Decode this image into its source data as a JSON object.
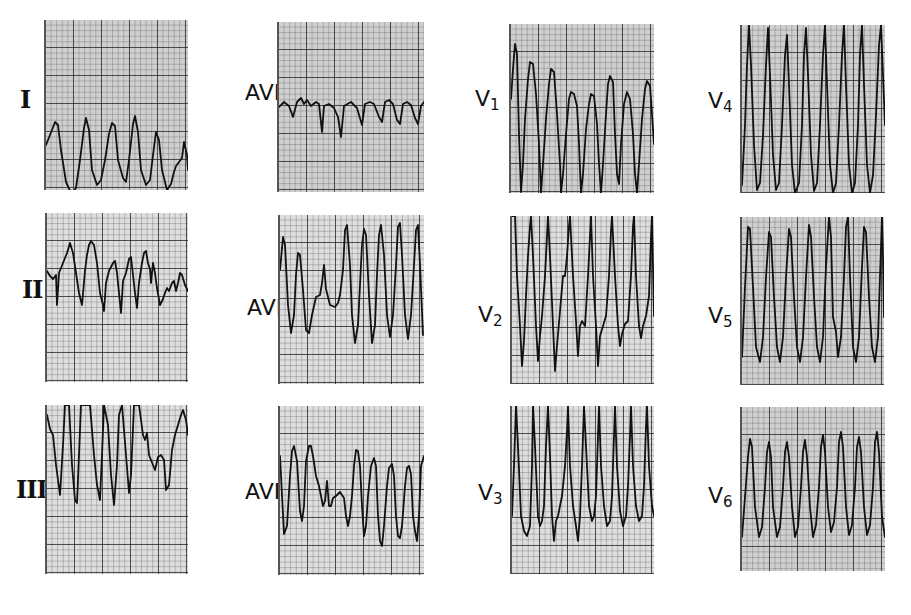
{
  "figure": {
    "leads": [
      {
        "id": "I",
        "label": "I",
        "sub": "",
        "roman": true,
        "panel": {
          "x": 44,
          "y": 20,
          "w": 142,
          "h": 170,
          "light": false
        },
        "labelPos": {
          "x": 20,
          "y": 100
        },
        "trace": "0,125 6,110 9,102 12,105 15,130 20,162 26,175 30,168 34,140 38,108 40,98 43,110 46,150 51,165 55,160 59,140 63,114 66,103 69,106 72,140 77,158 80,162 83,140 87,104 89,96 92,112 95,150 100,165 104,160 107,135 110,112 113,120 116,150 121,170 125,164 128,152 130,146 133,142 136,138 138,122 141,135 142,150"
      },
      {
        "id": "AVR",
        "label": "AVR",
        "sub": "",
        "roman": false,
        "panel": {
          "x": 277,
          "y": 22,
          "w": 145,
          "h": 170,
          "light": false
        },
        "labelPos": {
          "x": 245,
          "y": 94
        },
        "trace": "0,85 5,80 10,84 14,95 18,80 22,76 25,82 28,78 32,84 37,80 40,82 43,110 45,84 50,82 55,86 59,95 62,115 65,84 72,80 78,86 83,103 86,82 91,80 95,82 100,95 103,100 106,80 110,78 114,82 118,98 121,102 124,82 128,80 132,83 136,96 139,102 142,84 145,80"
      },
      {
        "id": "V1",
        "label": "V",
        "sub": "1",
        "roman": false,
        "panel": {
          "x": 509,
          "y": 24,
          "w": 143,
          "h": 169,
          "light": false
        },
        "labelPos": {
          "x": 475,
          "y": 100
        },
        "trace": "0,75 2,45 4,20 6,30 8,110 10,168 12,140 14,95 17,55 19,38 22,40 25,70 28,120 30,169 32,140 35,95 38,60 40,45 43,48 46,90 49,140 50,169 52,150 55,110 58,75 60,68 63,70 66,82 68,120 70,169 72,150 75,105 78,80 80,70 83,72 86,100 88,140 90,169 92,140 95,90 97,60 99,52 102,58 104,110 106,150 108,160 110,120 113,80 116,68 119,75 122,110 124,150 126,169 128,140 131,95 134,65 136,57 139,62 141,90 143,120"
      },
      {
        "id": "V4",
        "label": "V",
        "sub": "4",
        "roman": false,
        "panel": {
          "x": 740,
          "y": 25,
          "w": 143,
          "h": 168,
          "light": false
        },
        "labelPos": {
          "x": 708,
          "y": 102
        },
        "trace": "0,160 3,100 5,40 7,0 9,40 12,120 15,165 18,158 21,110 24,40 26,3 28,50 31,130 34,165 37,158 40,100 43,30 45,10 47,60 50,140 53,168 57,158 60,100 62,30 64,3 66,50 69,130 72,166 75,158 78,100 81,30 83,0 85,60 88,140 91,168 94,158 97,100 100,30 102,0 104,60 107,140 110,168 113,158 116,100 118,30 120,0 122,60 125,140 128,168 131,150 134,90 137,20 139,0 141,50 143,100"
      },
      {
        "id": "II",
        "label": "II",
        "sub": "",
        "roman": true,
        "panel": {
          "x": 45,
          "y": 213,
          "w": 141,
          "h": 169,
          "light": true
        },
        "labelPos": {
          "x": 22,
          "y": 290
        },
        "trace": "0,58 3,63 6,66 9,62 10,92 12,60 16,50 20,40 23,30 26,40 29,60 32,80 35,92 38,58 40,42 42,32 44,28 47,32 50,50 53,80 56,92 57,98 59,70 62,58 66,50 68,48 70,60 72,80 74,100 76,68 79,60 82,46 84,44 86,62 88,80 90,95 92,70 95,50 97,40 99,38 101,50 103,56 104,70 106,50 108,60 110,75 113,92 116,86 118,80 120,75 122,78 125,70 127,68 129,78 131,70 133,60 135,62 138,72 141,78"
      },
      {
        "id": "AVL",
        "label": "AVL",
        "sub": "",
        "roman": false,
        "panel": {
          "x": 278,
          "y": 215,
          "w": 144,
          "h": 169,
          "light": true
        },
        "labelPos": {
          "x": 247,
          "y": 94
        },
        "trace": "0,55 3,22 5,30 8,90 11,118 14,100 16,60 18,38 20,40 23,75 26,115 29,118 32,100 36,82 40,80 42,68 44,50 46,74 50,90 55,92 58,88 60,80 63,55 65,15 67,10 70,50 72,100 75,128 78,110 80,70 82,30 84,14 86,20 89,80 92,128 95,110 97,60 99,20 101,10 104,40 107,100 110,122 113,100 116,50 118,12 120,8 122,40 125,100 128,124 131,100 134,50 136,15 138,10 140,50 143,120"
      },
      {
        "id": "V2",
        "label": "V",
        "sub": "2",
        "roman": false,
        "panel": {
          "x": 510,
          "y": 216,
          "w": 142,
          "h": 168,
          "light": true
        },
        "labelPos": {
          "x": 478,
          "y": 100
        },
        "trace": "0,0 3,0 5,60 8,110 10,150 12,125 14,80 16,40 18,10 19,0 21,40 24,110 26,145 28,120 30,100 33,60 35,20 36,0 38,40 41,110 43,155 45,130 48,95 51,60 53,60 55,40 57,10 58,0 61,60 64,105 66,140 68,110 70,105 73,110 76,60 78,20 79,0 81,60 84,110 86,150 88,120 91,110 94,100 97,60 99,15 100,0 103,60 106,110 108,130 110,118 113,108 116,105 119,60 121,10 122,0 124,60 127,110 129,122 131,110 134,100 137,80 139,20 140,0 142,100"
      },
      {
        "id": "V5",
        "label": "V",
        "sub": "5",
        "roman": false,
        "panel": {
          "x": 740,
          "y": 217,
          "w": 142,
          "h": 168,
          "light": false
        },
        "labelPos": {
          "x": 708,
          "y": 100
        },
        "trace": "0,140 3,70 6,10 8,12 11,70 14,130 18,145 21,120 24,60 27,15 29,20 32,80 35,130 38,145 41,120 44,60 47,12 49,20 52,80 55,130 58,145 61,120 64,60 67,8 69,20 72,80 75,130 78,145 81,120 84,50 87,0 89,20 91,100 94,115 96,140 99,120 102,60 104,10 106,0 108,60 111,130 114,145 117,120 120,50 122,10 124,15 127,80 130,130 133,145 136,120 139,30 140,0 141,40 142,100"
      },
      {
        "id": "III",
        "label": "III",
        "sub": "",
        "roman": true,
        "panel": {
          "x": 45,
          "y": 405,
          "w": 141,
          "h": 169,
          "light": true
        },
        "labelPos": {
          "x": 16,
          "y": 85
        },
        "trace": "0,10 3,24 6,30 9,60 11,75 13,90 16,40 18,0 22,0 25,60 28,95 30,98 32,50 34,0 43,0 47,50 50,80 53,95 55,50 57,0 61,20 64,70 67,100 70,60 72,10 75,0 79,50 82,88 84,70 87,0 92,0 96,30 98,35 100,28 102,50 104,55 106,60 108,65 111,52 114,50 117,55 119,85 122,80 125,45 128,30 131,20 134,10 136,5 139,15 141,30"
      },
      {
        "id": "AVF",
        "label": "AVF",
        "sub": "",
        "roman": false,
        "panel": {
          "x": 278,
          "y": 406,
          "w": 144,
          "h": 169,
          "light": true
        },
        "labelPos": {
          "x": 245,
          "y": 87
        },
        "trace": "0,50 4,128 7,120 10,70 12,45 14,40 17,55 20,105 22,115 24,100 26,55 29,40 31,40 33,50 36,70 39,80 41,90 43,100 45,95 47,75 49,100 51,100 53,92 56,90 60,86 64,92 66,110 68,120 70,110 72,90 74,60 76,44 78,45 80,60 82,100 84,130 86,120 88,90 91,60 94,52 96,60 98,110 100,135 102,140 104,120 107,80 109,62 112,58 114,70 116,110 118,130 120,132 122,120 125,80 127,62 129,60 131,68 133,110 135,125 137,135 139,110 141,60 144,50"
      },
      {
        "id": "V3",
        "label": "V",
        "sub": "3",
        "roman": false,
        "panel": {
          "x": 510,
          "y": 406,
          "w": 142,
          "h": 168,
          "light": true
        },
        "labelPos": {
          "x": 478,
          "y": 88
        },
        "trace": "0,110 2,60 4,0 6,40 9,110 12,125 15,130 18,120 20,60 21,0 23,40 26,110 28,120 30,115 32,100 34,40 36,0 38,50 40,110 42,135 44,115 46,110 50,90 53,60 55,25 56,0 58,60 61,100 64,120 66,135 68,110 70,60 72,0 74,40 77,100 80,115 82,110 84,90 86,30 87,0 89,60 92,100 95,120 98,115 100,90 102,30 103,0 105,60 108,105 111,120 114,110 116,80 118,30 119,0 121,60 124,100 127,115 130,110 132,80 134,20 135,0 137,60 140,100 142,110"
      },
      {
        "id": "V6",
        "label": "V",
        "sub": "6",
        "roman": false,
        "panel": {
          "x": 740,
          "y": 407,
          "w": 143,
          "h": 164,
          "light": false
        },
        "labelPos": {
          "x": 708,
          "y": 90
        },
        "trace": "0,130 3,90 6,50 8,32 10,40 13,100 17,130 20,120 23,80 25,45 27,35 29,50 31,100 35,130 38,120 41,80 43,45 45,35 47,50 50,100 53,130 56,120 59,80 61,45 63,33 65,50 68,100 71,130 74,118 77,80 79,40 81,28 83,45 86,100 89,125 92,115 95,80 97,35 99,25 101,40 104,100 107,128 110,118 113,80 115,40 117,30 119,45 122,100 125,128 128,118 131,80 133,35 135,25 137,45 140,110 143,130"
      }
    ]
  },
  "style": {
    "trace_color": "#111111",
    "grid_major": "#282828",
    "grid_minor": "#5a5a5a",
    "paper": "#cfcfcf"
  }
}
